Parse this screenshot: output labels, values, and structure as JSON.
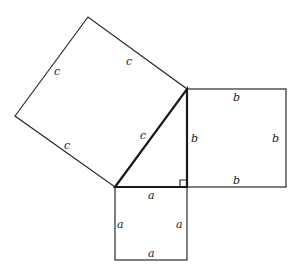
{
  "diagram": {
    "labels": {
      "c_top": "c",
      "c_left": "c",
      "c_bottom": "c",
      "c_hyp": "c",
      "b_top": "b",
      "b_left": "b",
      "b_right": "b",
      "b_bottom": "b",
      "a_top": "a",
      "a_left": "a",
      "a_right": "a",
      "a_bottom": "a"
    },
    "colors": {
      "stroke": "#2a2a2a",
      "background": "#ffffff"
    }
  }
}
